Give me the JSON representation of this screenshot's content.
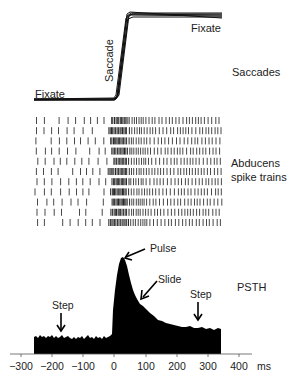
{
  "panels": {
    "saccades": {
      "label": "Saccades",
      "annotations": {
        "fixate_before": "Fixate",
        "saccade": "Saccade",
        "fixate_after": "Fixate"
      }
    },
    "raster": {
      "label_line1": "Abducens",
      "label_line2": "spike trains",
      "rows": 11
    },
    "psth": {
      "label": "PSTH",
      "annotations": {
        "step_left": "Step",
        "pulse": "Pulse",
        "slide": "Slide",
        "step_right": "Step"
      }
    }
  },
  "axis": {
    "ticks": [
      "−300",
      "−200",
      "−100",
      "0",
      "100",
      "200",
      "300",
      "400"
    ],
    "unit": "ms"
  },
  "chart_data": {
    "type": "area",
    "title": "",
    "xlabel": "ms",
    "ylabel": "",
    "xlim": [
      -300,
      420
    ],
    "x": [
      -260,
      -200,
      -150,
      -100,
      -50,
      -10,
      0,
      10,
      20,
      30,
      40,
      60,
      80,
      100,
      150,
      200,
      250,
      300,
      340
    ],
    "values": [
      0.22,
      0.22,
      0.21,
      0.21,
      0.21,
      0.22,
      0.5,
      0.9,
      1.0,
      0.92,
      0.75,
      0.62,
      0.55,
      0.48,
      0.38,
      0.32,
      0.3,
      0.29,
      0.29
    ],
    "annotations": [
      "Step (~-170 ms)",
      "Pulse (~20 ms)",
      "Slide (~80 ms)",
      "Step (~270 ms)"
    ]
  }
}
